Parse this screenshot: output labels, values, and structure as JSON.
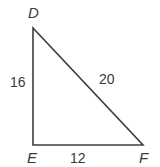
{
  "figure": {
    "type": "right-triangle-diagram",
    "canvas": {
      "width": 160,
      "height": 167,
      "background": "#ffffff"
    },
    "stroke_color": "#3c3c3c",
    "text_color": "#3a3a3a",
    "stroke_width": 1.6,
    "vertices": [
      {
        "name": "D",
        "label": "D",
        "x": 33,
        "y": 28
      },
      {
        "name": "E",
        "label": "E",
        "x": 33,
        "y": 145
      },
      {
        "name": "F",
        "label": "F",
        "x": 143,
        "y": 145
      }
    ],
    "polygon_points": "33,28 33,145 143,145",
    "sides": [
      {
        "name": "DE",
        "label": "16",
        "from": "D",
        "to": "E",
        "orientation": "vertical-left"
      },
      {
        "name": "DF",
        "label": "20",
        "from": "D",
        "to": "F",
        "orientation": "hypotenuse"
      },
      {
        "name": "EF",
        "label": "12",
        "from": "E",
        "to": "F",
        "orientation": "horizontal-bottom"
      }
    ]
  },
  "chart_data": {
    "type": "diagram",
    "title": "",
    "shape": "right triangle",
    "vertex_labels": [
      "D",
      "E",
      "F"
    ],
    "side_labels": {
      "DE": "16",
      "EF": "12",
      "DF": "20"
    },
    "side_values": {
      "DE": 16,
      "EF": 12,
      "DF": 20
    },
    "right_angle_at": "E",
    "units": ""
  }
}
